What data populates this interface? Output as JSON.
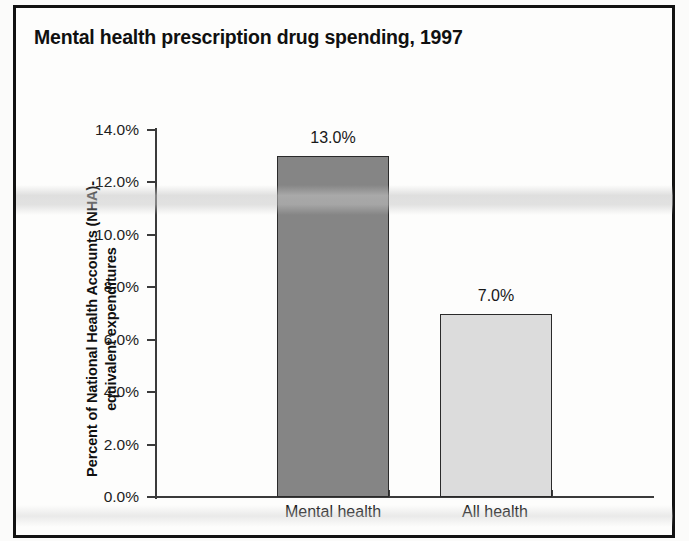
{
  "chart_data": {
    "type": "bar",
    "title": "Mental health prescription drug spending, 1997",
    "xlabel": "",
    "ylabel_line1": "Percent of National Health Accounts (NHA)-",
    "ylabel_line2": "equivalent expenditures",
    "categories": [
      "Mental health",
      "All health"
    ],
    "values": [
      13.0,
      7.0
    ],
    "value_labels": [
      "13.0%",
      "7.0%"
    ],
    "ylim": [
      0.0,
      14.0
    ],
    "ytick_values": [
      0.0,
      2.0,
      4.0,
      6.0,
      8.0,
      10.0,
      12.0,
      14.0
    ],
    "ytick_labels": [
      "0.0%",
      "2.0%",
      "4.0%",
      "6.0%",
      "8.0%",
      "10.0%",
      "12.0%",
      "14.0%"
    ],
    "grid": false,
    "legend": false,
    "bar_colors": [
      "#858585",
      "#dcdcdc"
    ],
    "bar_edge_color": "#2a2a2a",
    "axis_color": "#3b3b3b",
    "frame_color": "#121212",
    "background": "#fdfdfc"
  }
}
